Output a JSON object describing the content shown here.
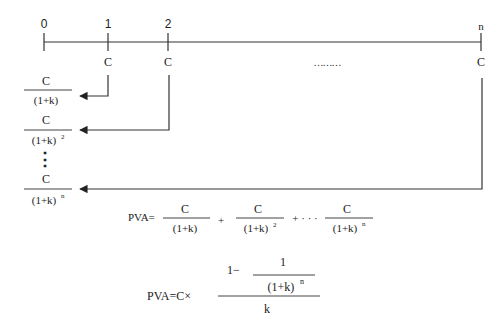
{
  "timeline": {
    "ticks": [
      {
        "label": "0",
        "x": 44
      },
      {
        "label": "1",
        "x": 108
      },
      {
        "label": "2",
        "x": 168
      },
      {
        "label": "n",
        "x": 481
      }
    ],
    "cash_flows": [
      {
        "label": "C",
        "x": 108
      },
      {
        "label": "C",
        "x": 168
      },
      {
        "label": "C",
        "x": 481
      }
    ],
    "ellipsis": "………"
  },
  "discounted": [
    {
      "numerator": "C",
      "denominator": "(1+k)",
      "exponent": ""
    },
    {
      "numerator": "C",
      "denominator": "(1+k)",
      "exponent": "2"
    },
    {
      "numerator": "C",
      "denominator": "(1+k)",
      "exponent": "n"
    }
  ],
  "vertical_dots": "⋮",
  "formula_sum": {
    "lhs": "PVA=",
    "terms": [
      {
        "numerator": "C",
        "denominator": "(1+k)",
        "exponent": ""
      },
      {
        "numerator": "C",
        "denominator": "(1+k)",
        "exponent": "2"
      },
      {
        "numerator": "C",
        "denominator": "(1+k)",
        "exponent": "n"
      }
    ],
    "plus": "+",
    "plus_dots": "+ · · ·"
  },
  "formula_closed": {
    "lhs": "PVA=C×",
    "one_minus": "1−",
    "inner_numerator": "1",
    "inner_denominator": "(1+k)",
    "inner_exponent": "n",
    "denominator": "k"
  },
  "colors": {
    "ink": "#222222",
    "line": "#333333",
    "background": "#ffffff"
  }
}
